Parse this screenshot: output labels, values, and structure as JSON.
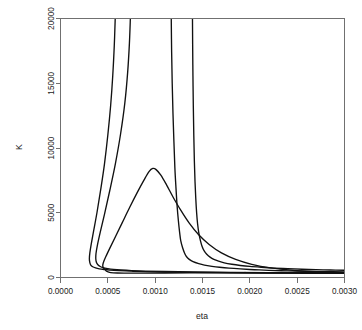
{
  "chart_data": {
    "type": "line",
    "title": "",
    "subtitle": "",
    "xlabel": "eta",
    "ylabel": "K",
    "xlim": [
      0.0,
      0.003
    ],
    "ylim": [
      0,
      20000
    ],
    "grid": false,
    "legend": "none",
    "plot_style": "R base graphics contour plot, black curves on white, grey axis box",
    "xticks": [
      {
        "value": 0.0,
        "label": "0.0000"
      },
      {
        "value": 0.0005,
        "label": "0.0005"
      },
      {
        "value": 0.001,
        "label": "0.0010"
      },
      {
        "value": 0.0015,
        "label": "0.0015"
      },
      {
        "value": 0.002,
        "label": "0.0020"
      },
      {
        "value": 0.0025,
        "label": "0.0025"
      },
      {
        "value": 0.003,
        "label": "0.0030"
      }
    ],
    "yticks": [
      {
        "value": 0,
        "label": "0"
      },
      {
        "value": 5000,
        "label": "5000"
      },
      {
        "value": 10000,
        "label": "10000"
      },
      {
        "value": 15000,
        "label": "15000"
      },
      {
        "value": 20000,
        "label": "20000"
      }
    ],
    "annotations": [
      {
        "text": "·",
        "x": 0.00146,
        "y": 700,
        "name": "contour-label-inner"
      },
      {
        "text": "··",
        "x": 0.00195,
        "y": 330,
        "name": "contour-label-outer"
      }
    ],
    "series": [
      {
        "name": "contour-1",
        "description": "innermost steep branch; turns at left near eta 0.00031, rises off top of panel at eta 0.00057",
        "points": [
          [
            0.003,
            320
          ],
          [
            0.0026,
            330
          ],
          [
            0.0022,
            345
          ],
          [
            0.0018,
            365
          ],
          [
            0.0014,
            395
          ],
          [
            0.0011,
            425
          ],
          [
            0.0009,
            455
          ],
          [
            0.00075,
            490
          ],
          [
            0.00062,
            530
          ],
          [
            0.00052,
            575
          ],
          [
            0.00046,
            620
          ],
          [
            0.00041,
            670
          ],
          [
            0.00037,
            740
          ],
          [
            0.00034,
            830
          ],
          [
            0.00032,
            960
          ],
          [
            0.00031,
            1150
          ],
          [
            0.000305,
            1450
          ],
          [
            0.00031,
            1900
          ],
          [
            0.000325,
            2600
          ],
          [
            0.00035,
            3600
          ],
          [
            0.000385,
            5000
          ],
          [
            0.000425,
            6800
          ],
          [
            0.000465,
            8800
          ],
          [
            0.0005,
            11000
          ],
          [
            0.00053,
            13300
          ],
          [
            0.000552,
            15600
          ],
          [
            0.000568,
            17900
          ],
          [
            0.000578,
            20000
          ]
        ]
      },
      {
        "name": "contour-2",
        "description": "second steep branch; turns at left near eta 0.00037, rises off top of panel at eta 0.00072",
        "points": [
          [
            0.003,
            340
          ],
          [
            0.0026,
            352
          ],
          [
            0.0022,
            370
          ],
          [
            0.0018,
            392
          ],
          [
            0.0014,
            425
          ],
          [
            0.0011,
            460
          ],
          [
            0.0009,
            495
          ],
          [
            0.00075,
            535
          ],
          [
            0.00064,
            580
          ],
          [
            0.00056,
            630
          ],
          [
            0.0005,
            690
          ],
          [
            0.00045,
            760
          ],
          [
            0.00042,
            850
          ],
          [
            0.000395,
            980
          ],
          [
            0.00038,
            1160
          ],
          [
            0.000373,
            1430
          ],
          [
            0.000375,
            1850
          ],
          [
            0.00039,
            2500
          ],
          [
            0.00042,
            3500
          ],
          [
            0.000465,
            4900
          ],
          [
            0.00052,
            6700
          ],
          [
            0.00058,
            8800
          ],
          [
            0.000635,
            11100
          ],
          [
            0.00068,
            13500
          ],
          [
            0.00071,
            15900
          ],
          [
            0.000728,
            18100
          ],
          [
            0.000738,
            20000
          ]
        ]
      },
      {
        "name": "contour-3",
        "description": "hump contour: rises from left turn near eta 0.00044, peaks about K = 8400 at eta 0.00096, then decays to the right baseline",
        "points": [
          [
            0.00047,
            640
          ],
          [
            0.000455,
            720
          ],
          [
            0.000448,
            830
          ],
          [
            0.000447,
            980
          ],
          [
            0.000455,
            1200
          ],
          [
            0.000478,
            1600
          ],
          [
            0.00052,
            2250
          ],
          [
            0.00058,
            3150
          ],
          [
            0.00065,
            4200
          ],
          [
            0.00073,
            5400
          ],
          [
            0.00081,
            6550
          ],
          [
            0.00088,
            7500
          ],
          [
            0.000935,
            8180
          ],
          [
            0.000975,
            8420
          ],
          [
            0.00101,
            8330
          ],
          [
            0.00106,
            7900
          ],
          [
            0.00112,
            7150
          ],
          [
            0.00119,
            6200
          ],
          [
            0.00127,
            5200
          ],
          [
            0.00136,
            4200
          ],
          [
            0.00146,
            3300
          ],
          [
            0.00157,
            2550
          ],
          [
            0.0017,
            1900
          ],
          [
            0.00185,
            1400
          ],
          [
            0.00202,
            1020
          ],
          [
            0.00222,
            740
          ],
          [
            0.00245,
            560
          ],
          [
            0.0027,
            450
          ],
          [
            0.003,
            380
          ],
          [
            0.0027,
            372
          ],
          [
            0.0023,
            368
          ],
          [
            0.0019,
            362
          ],
          [
            0.0015,
            356
          ],
          [
            0.0011,
            350
          ],
          [
            0.00085,
            344
          ],
          [
            0.0007,
            340
          ],
          [
            0.0006,
            345
          ],
          [
            0.00053,
            380
          ],
          [
            0.00049,
            470
          ],
          [
            0.000475,
            570
          ],
          [
            0.00047,
            640
          ]
        ]
      },
      {
        "name": "contour-4",
        "description": "third steep branch; rises off the top of the panel at eta 0.00117 and decays to the right baseline",
        "points": [
          [
            0.003,
            430
          ],
          [
            0.0028,
            450
          ],
          [
            0.0026,
            475
          ],
          [
            0.0024,
            510
          ],
          [
            0.0022,
            555
          ],
          [
            0.00205,
            600
          ],
          [
            0.0019,
            660
          ],
          [
            0.00178,
            720
          ],
          [
            0.00168,
            790
          ],
          [
            0.0016,
            865
          ],
          [
            0.00152,
            960
          ],
          [
            0.00146,
            1070
          ],
          [
            0.0014,
            1220
          ],
          [
            0.00136,
            1400
          ],
          [
            0.00133,
            1620
          ],
          [
            0.00131,
            1900
          ],
          [
            0.00129,
            2300
          ],
          [
            0.00127,
            2850
          ],
          [
            0.001258,
            3500
          ],
          [
            0.001245,
            4400
          ],
          [
            0.001232,
            5500
          ],
          [
            0.00122,
            6900
          ],
          [
            0.001208,
            8500
          ],
          [
            0.001198,
            10500
          ],
          [
            0.001188,
            12700
          ],
          [
            0.00118,
            15000
          ],
          [
            0.001174,
            17400
          ],
          [
            0.00117,
            20000
          ]
        ]
      },
      {
        "name": "contour-5",
        "description": "outermost steep branch; rises off the top of the panel at eta 0.00142 and decays to the right baseline",
        "points": [
          [
            0.003,
            560
          ],
          [
            0.00285,
            580
          ],
          [
            0.0027,
            605
          ],
          [
            0.00255,
            640
          ],
          [
            0.0024,
            680
          ],
          [
            0.00225,
            730
          ],
          [
            0.00212,
            790
          ],
          [
            0.002,
            855
          ],
          [
            0.0019,
            930
          ],
          [
            0.00181,
            1020
          ],
          [
            0.00173,
            1130
          ],
          [
            0.00167,
            1260
          ],
          [
            0.00162,
            1400
          ],
          [
            0.00158,
            1570
          ],
          [
            0.001545,
            1790
          ],
          [
            0.001518,
            2050
          ],
          [
            0.001496,
            2400
          ],
          [
            0.001478,
            2850
          ],
          [
            0.001462,
            3400
          ],
          [
            0.001448,
            4150
          ],
          [
            0.001438,
            5000
          ],
          [
            0.001429,
            6100
          ],
          [
            0.001421,
            7400
          ],
          [
            0.001414,
            9000
          ],
          [
            0.001408,
            11000
          ],
          [
            0.001403,
            13200
          ],
          [
            0.001399,
            15600
          ],
          [
            0.001396,
            18000
          ],
          [
            0.001394,
            20000
          ]
        ]
      }
    ]
  },
  "axis": {
    "x_title": "eta",
    "y_title": "K"
  },
  "colors": {
    "curve": "#111111",
    "axis": "#707070",
    "text": "#1a1a1a",
    "background": "#ffffff"
  }
}
